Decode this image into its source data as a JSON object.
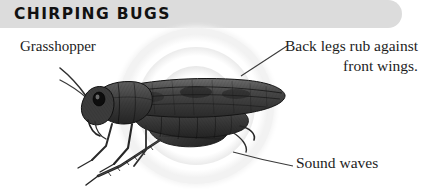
{
  "header": {
    "title": "CHIRPING BUGS",
    "banner_color": "#dcdcdc",
    "title_color": "#111111"
  },
  "labels": {
    "subject": "Grasshopper",
    "callout_back_legs": "Back legs rub against front wings.",
    "callout_sound_waves": "Sound waves"
  },
  "illustration": {
    "subject_name": "grasshopper-engraving",
    "ink_color": "#2b2b2b",
    "ring_color": "#eeeeee",
    "leader_line_color": "#3a3a3a"
  },
  "page": {
    "background": "#ffffff",
    "width": 421,
    "height": 191
  }
}
